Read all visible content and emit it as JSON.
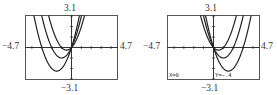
{
  "chart_data": [
    {
      "type": "line",
      "title": "",
      "window": {
        "xmin": -4.7,
        "xmax": 4.7,
        "ymin": -3.1,
        "ymax": 3.1
      },
      "tick_labels": {
        "top": "3.1",
        "bottom": "-3.1",
        "left": "-4.7",
        "right": "4.7"
      },
      "series": [
        {
          "name": "y = x^2 + x",
          "b": 1
        },
        {
          "name": "y = x^2 + 2x",
          "b": 2
        },
        {
          "name": "y = x^2 + 3x",
          "b": 3
        }
      ],
      "grid": false,
      "trace": null
    },
    {
      "type": "line",
      "title": "",
      "window": {
        "xmin": -4.7,
        "xmax": 4.7,
        "ymin": -3.1,
        "ymax": 3.1
      },
      "tick_labels": {
        "top": "3.1",
        "bottom": "-3.1",
        "left": "-4.7",
        "right": "4.7"
      },
      "series": [
        {
          "name": "y = x^2 - x",
          "b": -1
        },
        {
          "name": "y = x^2 - 2x",
          "b": -2
        },
        {
          "name": "y = x^2 - 3x",
          "b": -3
        }
      ],
      "grid": false,
      "trace": {
        "x_label": "X=0",
        "y_label": "Y=-.4"
      }
    }
  ],
  "left": {
    "top": "3.1",
    "bottom": "−3.1",
    "xmin": "−4.7",
    "xmax": "4.7"
  },
  "right": {
    "top": "3.1",
    "bottom": "−3.1",
    "xmin": "−4.7",
    "xmax": "4.7",
    "trace_x": "X=0",
    "trace_y": "Y=−.4"
  }
}
